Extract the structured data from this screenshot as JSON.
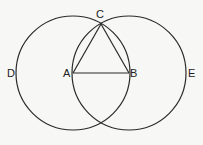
{
  "diagram": {
    "stroke_color": "#2a2a2a",
    "background": "#f7f7f5",
    "points": {
      "A": {
        "label": "A",
        "x": 73,
        "y": 73
      },
      "B": {
        "label": "B",
        "x": 129,
        "y": 73
      },
      "C": {
        "label": "C",
        "x": 101,
        "y": 24
      },
      "D": {
        "label": "D",
        "x": 16,
        "y": 73
      },
      "E": {
        "label": "E",
        "x": 186,
        "y": 73
      }
    },
    "labels": {
      "A": "A",
      "B": "B",
      "C": "C",
      "D": "D",
      "E": "E"
    },
    "circles": [
      {
        "name": "circle-center-A",
        "cx": 73,
        "cy": 73,
        "r": 57
      },
      {
        "name": "circle-center-B",
        "cx": 129,
        "cy": 73,
        "r": 57
      }
    ],
    "segments": [
      {
        "name": "AB",
        "from": "A",
        "to": "B"
      },
      {
        "name": "AC",
        "from": "A",
        "to": "C"
      },
      {
        "name": "BC",
        "from": "B",
        "to": "C"
      }
    ]
  }
}
